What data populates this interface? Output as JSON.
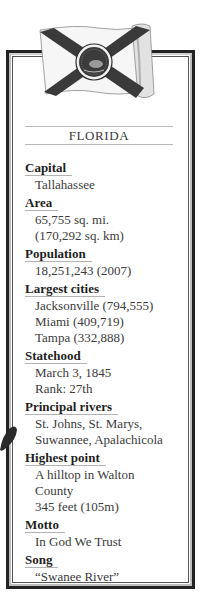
{
  "state": {
    "name": "FLORIDA"
  },
  "flag": {
    "icon": "florida-flag-icon",
    "colors": {
      "field": "#f4f4f4",
      "saltire": "#3a3a3a",
      "seal": "#2e2e2e"
    }
  },
  "facts": [
    {
      "label": "Capital",
      "values": [
        "Tallahassee"
      ]
    },
    {
      "label": "Area",
      "values": [
        "65,755 sq. mi.",
        "(170,292 sq. km)"
      ]
    },
    {
      "label": "Population",
      "values": [
        "18,251,243 (2007)"
      ]
    },
    {
      "label": "Largest cities",
      "values": [
        "Jacksonville (794,555)",
        "Miami (409,719)",
        "Tampa (332,888)"
      ]
    },
    {
      "label": "Statehood",
      "values": [
        "March 3, 1845",
        "Rank: 27th"
      ]
    },
    {
      "label": "Principal rivers",
      "values": [
        "St. Johns, St. Marys,",
        "Suwannee, Apalachicola"
      ]
    },
    {
      "label": "Highest point",
      "values": [
        "A hilltop in Walton",
        "County",
        "345 feet (105m)"
      ]
    },
    {
      "label": "Motto",
      "values": [
        "In God We Trust"
      ]
    },
    {
      "label": "Song",
      "values": [
        "“Swanee River”"
      ]
    }
  ]
}
